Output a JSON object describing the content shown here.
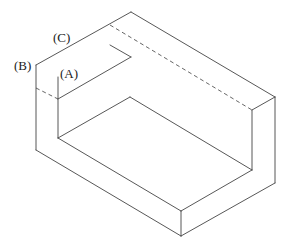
{
  "figure": {
    "type": "isometric-line-drawing",
    "stroke_color": "#444444",
    "labels": [
      {
        "id": "A",
        "text": "(A)",
        "x": 60,
        "y": 67
      },
      {
        "id": "B",
        "text": "(B)",
        "x": 14,
        "y": 59
      },
      {
        "id": "C",
        "text": "(C)",
        "x": 53,
        "y": 31
      }
    ]
  }
}
